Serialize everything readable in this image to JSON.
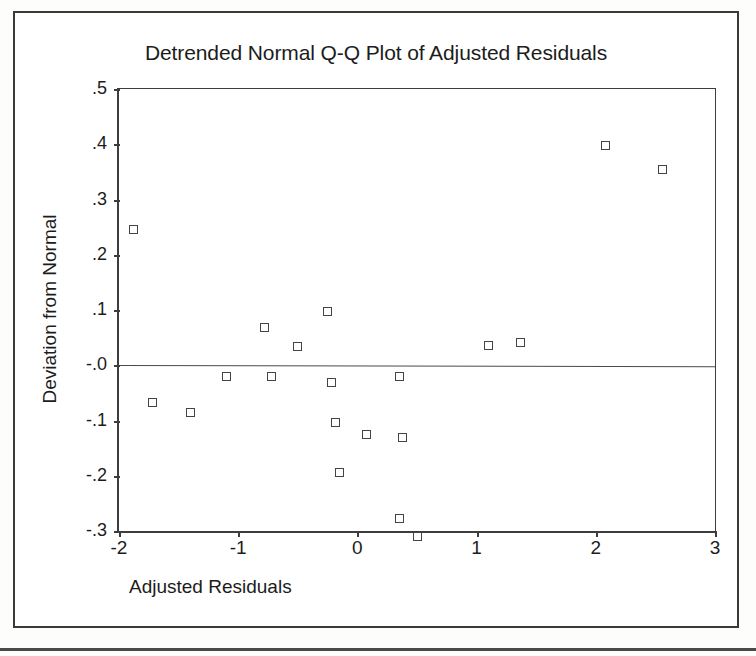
{
  "figure": {
    "title": "Detrended Normal Q-Q Plot of Adjusted Residuals",
    "x_axis_title": "Adjusted Residuals",
    "y_axis_title": "Deviation from Normal"
  },
  "chart_data": {
    "type": "scatter",
    "title": "Detrended Normal Q-Q Plot of Adjusted Residuals",
    "xlabel": "Adjusted Residuals",
    "ylabel": "Deviation from Normal",
    "xlim": [
      -2,
      3
    ],
    "ylim": [
      -0.3,
      0.5
    ],
    "xticks": [
      -2,
      -1,
      0,
      1,
      2,
      3
    ],
    "xticklabels": [
      "-2",
      "-1",
      "0",
      "1",
      "2",
      "3"
    ],
    "yticks": [
      0.5,
      0.4,
      0.3,
      0.2,
      0.1,
      -0.0,
      -0.1,
      -0.2,
      -0.3
    ],
    "yticklabels": [
      ".5",
      ".4",
      ".3",
      ".2",
      ".1",
      "-.0",
      "-.1",
      "-.2",
      "-.3"
    ],
    "grid": false,
    "legend": false,
    "reference_line": {
      "y": 0.0,
      "label": "zero deviation"
    },
    "marker": {
      "shape": "square",
      "filled": false,
      "edge_color": "#444444"
    },
    "points": [
      {
        "x": -1.88,
        "y": 0.245
      },
      {
        "x": -1.72,
        "y": -0.067
      },
      {
        "x": -1.4,
        "y": -0.086
      },
      {
        "x": -1.1,
        "y": -0.021
      },
      {
        "x": -0.78,
        "y": 0.069
      },
      {
        "x": -0.72,
        "y": -0.021
      },
      {
        "x": -0.5,
        "y": 0.034
      },
      {
        "x": -0.25,
        "y": 0.097
      },
      {
        "x": -0.22,
        "y": -0.031
      },
      {
        "x": -0.18,
        "y": -0.104
      },
      {
        "x": -0.15,
        "y": -0.195
      },
      {
        "x": 0.08,
        "y": -0.126
      },
      {
        "x": 0.35,
        "y": -0.02
      },
      {
        "x": 0.38,
        "y": -0.131
      },
      {
        "x": 0.35,
        "y": -0.277
      },
      {
        "x": 0.5,
        "y": -0.31
      },
      {
        "x": 1.1,
        "y": 0.035
      },
      {
        "x": 1.37,
        "y": 0.042
      },
      {
        "x": 2.08,
        "y": 0.397
      },
      {
        "x": 2.56,
        "y": 0.355
      }
    ]
  }
}
